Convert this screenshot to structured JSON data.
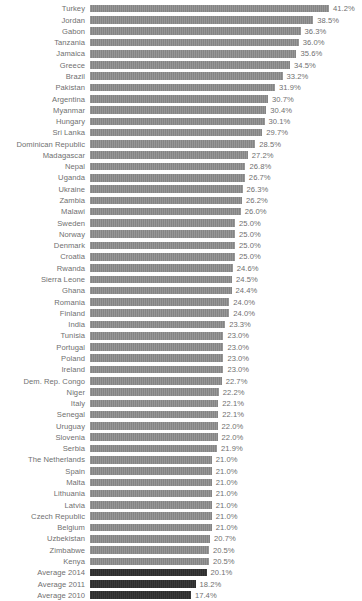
{
  "chart_data": {
    "type": "bar",
    "orientation": "horizontal",
    "title": "",
    "subtitle": "",
    "xlabel": "",
    "ylabel": "",
    "grid": false,
    "legend": "none",
    "xlim": [
      0,
      41.2
    ],
    "value_suffix": "%",
    "colors": {
      "bar": "#8c8c8c",
      "average_bar": "#303030",
      "label_text": "#6f6f6f",
      "background": "#ffffff"
    },
    "categories": [
      "Turkey",
      "Jordan",
      "Gabon",
      "Tanzania",
      "Jamaica",
      "Greece",
      "Brazil",
      "Pakistan",
      "Argentina",
      "Myanmar",
      "Hungary",
      "Sri Lanka",
      "Dominican Republic",
      "Madagascar",
      "Nepal",
      "Uganda",
      "Ukraine",
      "Zambia",
      "Malawi",
      "Sweden",
      "Norway",
      "Denmark",
      "Croatia",
      "Rwanda",
      "Sierra Leone",
      "Ghana",
      "Romania",
      "Finland",
      "India",
      "Tunisia",
      "Portugal",
      "Poland",
      "Ireland",
      "Dem. Rep. Congo",
      "Niger",
      "Italy",
      "Senegal",
      "Uruguay",
      "Slovenia",
      "Serbia",
      "The Netherlands",
      "Spain",
      "Malta",
      "Lithuania",
      "Latvia",
      "Czech Republic",
      "Belgium",
      "Uzbekistan",
      "Zimbabwe",
      "Kenya",
      "Average 2014",
      "Average 2011",
      "Average 2010"
    ],
    "values": [
      41.2,
      38.5,
      36.3,
      36.0,
      35.6,
      34.5,
      33.2,
      31.9,
      30.7,
      30.4,
      30.1,
      29.7,
      28.5,
      27.2,
      26.8,
      26.7,
      26.3,
      26.2,
      26.0,
      25.0,
      25.0,
      25.0,
      25.0,
      24.6,
      24.5,
      24.4,
      24.0,
      24.0,
      23.3,
      23.0,
      23.0,
      23.0,
      23.0,
      22.7,
      22.2,
      22.1,
      22.1,
      22.0,
      22.0,
      21.9,
      21.0,
      21.0,
      21.0,
      21.0,
      21.0,
      21.0,
      21.0,
      20.7,
      20.5,
      20.5,
      20.1,
      18.2,
      17.4
    ],
    "value_labels": [
      "41.2%",
      "38.5%",
      "36.3%",
      "36.0%",
      "35.6%",
      "34.5%",
      "33.2%",
      "31.9%",
      "30.7%",
      "30.4%",
      "30.1%",
      "29.7%",
      "28.5%",
      "27.2%",
      "26.8%",
      "26.7%",
      "26.3%",
      "26.2%",
      "26.0%",
      "25.0%",
      "25.0%",
      "25.0%",
      "25.0%",
      "24.6%",
      "24.5%",
      "24.4%",
      "24.0%",
      "24.0%",
      "23.3%",
      "23.0%",
      "23.0%",
      "23.0%",
      "23.0%",
      "22.7%",
      "22.2%",
      "22.1%",
      "22.1%",
      "22.0%",
      "22.0%",
      "21.9%",
      "21.0%",
      "21.0%",
      "21.0%",
      "21.0%",
      "21.0%",
      "21.0%",
      "21.0%",
      "20.7%",
      "20.5%",
      "20.5%",
      "20.1%",
      "18.2%",
      "17.4%"
    ],
    "highlight_indices": [
      50,
      51,
      52
    ]
  }
}
